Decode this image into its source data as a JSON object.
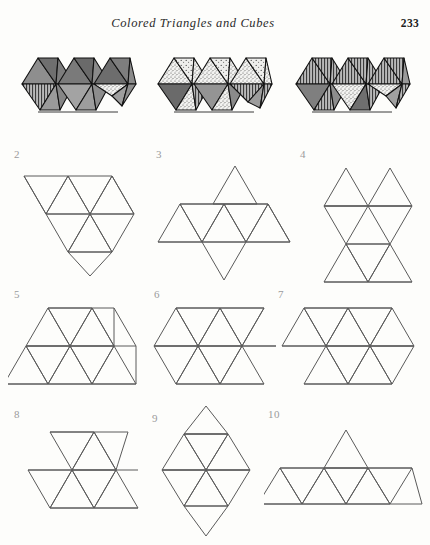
{
  "page": {
    "header_title": "Colored Triangles and Cubes",
    "page_number": "233",
    "background_color": "#fdfdfb",
    "ink_color": "#4a4a4a",
    "label_color": "#9b9b9b"
  },
  "plates": {
    "caption_note": "three shaded polyhedral clusters",
    "items": [
      {
        "name": "plate-left",
        "description": "cluster of three hexagonal triangulated discs, solid gray shading with one stippled face and one vertically hatched face",
        "face_styles": [
          "solid-dark",
          "solid-mid",
          "solid-light",
          "vertical-hatch",
          "stipple"
        ]
      },
      {
        "name": "plate-center",
        "description": "cluster of three hexagonal triangulated discs, predominantly stippled faces with vertical hatching and dark solids",
        "face_styles": [
          "stipple",
          "solid-dark",
          "vertical-hatch",
          "solid-mid",
          "solid-light"
        ]
      },
      {
        "name": "plate-right",
        "description": "cluster of three hexagonal triangulated discs, predominantly vertically hatched faces with stippled and solid faces",
        "face_styles": [
          "vertical-hatch",
          "solid-mid",
          "stipple",
          "solid-dark",
          "solid-light"
        ]
      }
    ]
  },
  "nets": [
    {
      "label": "2",
      "name": "net-2",
      "description": "V-shaped net of ten equilateral triangles",
      "triangle_count": 10
    },
    {
      "label": "3",
      "name": "net-3",
      "description": "horizontal strip net with one triangle above and one below",
      "triangle_count": 10
    },
    {
      "label": "4",
      "name": "net-4",
      "description": "vertical two-column net of triangles",
      "triangle_count": 10
    },
    {
      "label": "5",
      "name": "net-5",
      "description": "trapezoidal net, three triangles on top row over five on bottom row",
      "triangle_count": 10
    },
    {
      "label": "6",
      "name": "net-6",
      "description": "parallelogram strip net of ten triangles",
      "triangle_count": 10
    },
    {
      "label": "7",
      "name": "net-7",
      "description": "offset double strip net of ten triangles",
      "triangle_count": 10
    },
    {
      "label": "8",
      "name": "net-8",
      "description": "upper short strip over lower long strip net",
      "triangle_count": 10
    },
    {
      "label": "9",
      "name": "net-9",
      "description": "rhombus shaped net of ten triangles",
      "triangle_count": 10
    },
    {
      "label": "10",
      "name": "net-10",
      "description": "long horizontal strip with a single triangle peak on top",
      "triangle_count": 10
    }
  ]
}
